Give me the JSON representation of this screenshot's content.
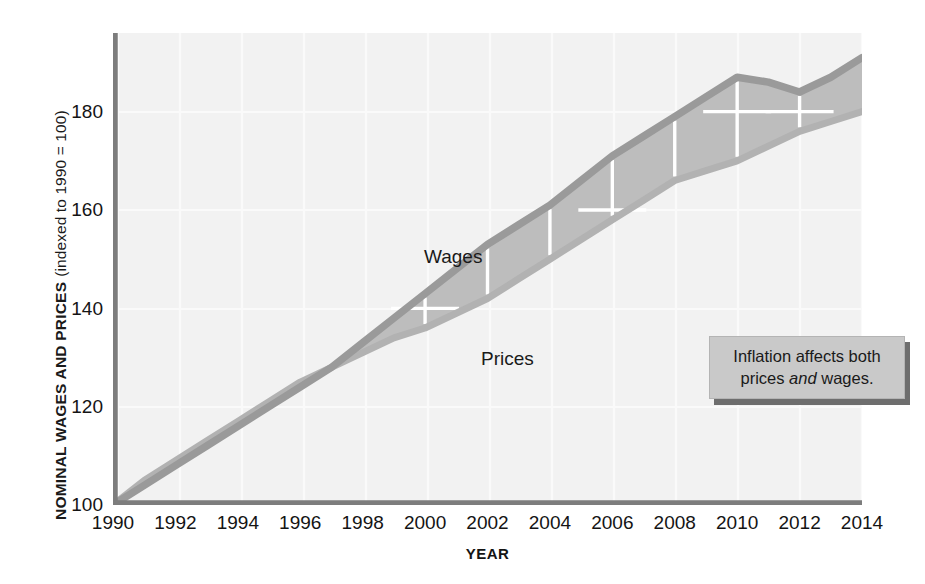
{
  "figure": {
    "title": "",
    "y_axis_title_main": "NOMINAL WAGES AND PRICES",
    "y_axis_title_sub": "(indexed to 1990 = 100)",
    "x_axis_title": "YEAR"
  },
  "callout": {
    "line1_before": "Inflation affects both",
    "line2_before": "prices ",
    "line2_emphasis": "and",
    "line2_after": " wages.",
    "full_text": "Inflation affects both prices and wages.",
    "fill_color": "#c9c9c9",
    "shadow_color": "#6e6e6e"
  },
  "series_labels": {
    "wages": "Wages",
    "prices": "Prices"
  },
  "colors": {
    "band_fill": "#bdbdbd",
    "wages_line": "#9a9a9a",
    "prices_line": "#b0b0b0",
    "axis": "#7a7a7a",
    "plot_background": "#f2f2f2",
    "gridline": "#fbfbfb",
    "tick_marker": "#ffffff",
    "text": "#141414"
  },
  "chart_data": {
    "type": "area",
    "title": "",
    "xlabel": "YEAR",
    "ylabel": "NOMINAL WAGES AND PRICES (indexed to 1990 = 100)",
    "xlim": [
      1990,
      2014
    ],
    "ylim": [
      100,
      196
    ],
    "ytick_values": [
      100,
      120,
      140,
      160,
      180
    ],
    "ytick_labels": [
      "100",
      "120",
      "140",
      "160",
      "180"
    ],
    "xtick_values": [
      1990,
      1992,
      1994,
      1996,
      1998,
      2000,
      2002,
      2004,
      2006,
      2008,
      2010,
      2012,
      2014
    ],
    "xtick_labels": [
      "1990",
      "1992",
      "1994",
      "1996",
      "1998",
      "2000",
      "2002",
      "2004",
      "2006",
      "2008",
      "2010",
      "2012",
      "2014"
    ],
    "grid": true,
    "legend": "inline-labels",
    "x": [
      1990,
      1991,
      1992,
      1993,
      1994,
      1995,
      1996,
      1997,
      1998,
      1999,
      2000,
      2001,
      2002,
      2003,
      2004,
      2005,
      2006,
      2007,
      2008,
      2009,
      2010,
      2011,
      2012,
      2013,
      2014
    ],
    "series": [
      {
        "name": "Wages",
        "values": [
          100,
          104,
          108,
          112,
          116,
          120,
          124,
          128,
          133,
          138,
          143,
          148,
          153,
          157,
          161,
          166,
          171,
          175,
          179,
          183,
          187,
          186,
          184,
          187,
          191
        ]
      },
      {
        "name": "Prices",
        "values": [
          100,
          105,
          109,
          113,
          117,
          121,
          125,
          128,
          131,
          134,
          136,
          139,
          142,
          146,
          150,
          154,
          158,
          162,
          166,
          168,
          170,
          173,
          176,
          178,
          180
        ]
      }
    ],
    "tick_markers": [
      {
        "year": 2000,
        "value": 140
      },
      {
        "year": 2002,
        "value": 153
      },
      {
        "year": 2004,
        "value": 161
      },
      {
        "year": 2006,
        "value": 160
      },
      {
        "year": 2008,
        "value": 179
      },
      {
        "year": 2010,
        "value": 180
      },
      {
        "year": 2012,
        "value": 180
      }
    ],
    "annotations": [
      {
        "text": "Wages",
        "x": 2000,
        "y": 152
      },
      {
        "text": "Prices",
        "x": 2002,
        "y": 131
      },
      {
        "text": "Inflation affects both prices and wages.",
        "x": 2007,
        "y": 137
      }
    ]
  }
}
